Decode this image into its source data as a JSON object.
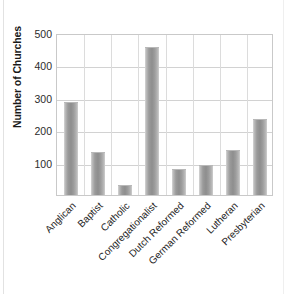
{
  "chart_data": {
    "type": "bar",
    "title": "",
    "xlabel": "",
    "ylabel": "Number of Churches",
    "categories": [
      "Anglican",
      "Baptist",
      "Catholic",
      "Congregationalist",
      "Dutch Reformed",
      "German Reformed",
      "Lutheran",
      "Presbyterian"
    ],
    "values": [
      287,
      133,
      30,
      457,
      80,
      92,
      140,
      235
    ],
    "ylim": [
      0,
      500
    ],
    "ytick_labels": [
      "500",
      "400",
      "300",
      "200",
      "100"
    ],
    "ytick_values": [
      500,
      400,
      300,
      200,
      100
    ],
    "grid": "horizontal-and-vertical",
    "legend": "none",
    "bar_color": "#9a9a9a",
    "plot_border_color": "#c9c9c9",
    "gridline_color": "#d2d2d2",
    "text_color": "#252525"
  },
  "axis": {
    "y_title": "Number of Churches"
  }
}
